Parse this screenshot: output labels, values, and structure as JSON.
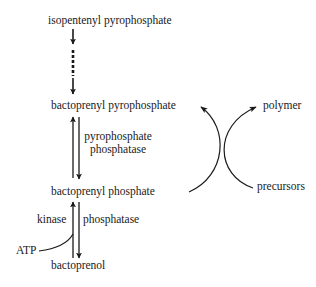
{
  "diagram": {
    "type": "biosynthetic pathway",
    "nodes": {
      "isopentenyl_pyrophosphate": "isopentenyl pyrophosphate",
      "bactoprenyl_pyrophosphate": "bactoprenyl pyrophosphate",
      "bactoprenyl_phosphate": "bactoprenyl phosphate",
      "bactoprenol": "bactoprenol"
    },
    "enzymes": {
      "pyrophosphate_phosphatase_line1": "pyrophosphate",
      "pyrophosphate_phosphatase_line2": "phosphatase",
      "kinase": "kinase",
      "phosphatase": "phosphatase"
    },
    "cofactors": {
      "atp": "ATP"
    },
    "cycle": {
      "polymer": "polymer",
      "precursors": "precursors"
    },
    "edges": [
      {
        "from": "isopentenyl pyrophosphate",
        "to": "bactoprenyl pyrophosphate",
        "style": "dashed multi-step"
      },
      {
        "from": "bactoprenyl phosphate",
        "to": "bactoprenyl pyrophosphate",
        "style": "solid"
      },
      {
        "from": "bactoprenyl pyrophosphate",
        "to": "bactoprenyl phosphate",
        "style": "solid",
        "enzyme": "pyrophosphate phosphatase"
      },
      {
        "from": "bactoprenol",
        "to": "bactoprenyl phosphate",
        "style": "solid",
        "enzyme": "kinase",
        "cofactor": "ATP"
      },
      {
        "from": "bactoprenyl phosphate",
        "to": "bactoprenol",
        "style": "solid",
        "enzyme": "phosphatase"
      },
      {
        "from": "bactoprenyl phosphate",
        "to": "bactoprenyl pyrophosphate",
        "style": "curved",
        "via": "precursors to polymer"
      }
    ],
    "colors": {
      "ink": "#1a1a1a",
      "background": "#ffffff"
    }
  }
}
